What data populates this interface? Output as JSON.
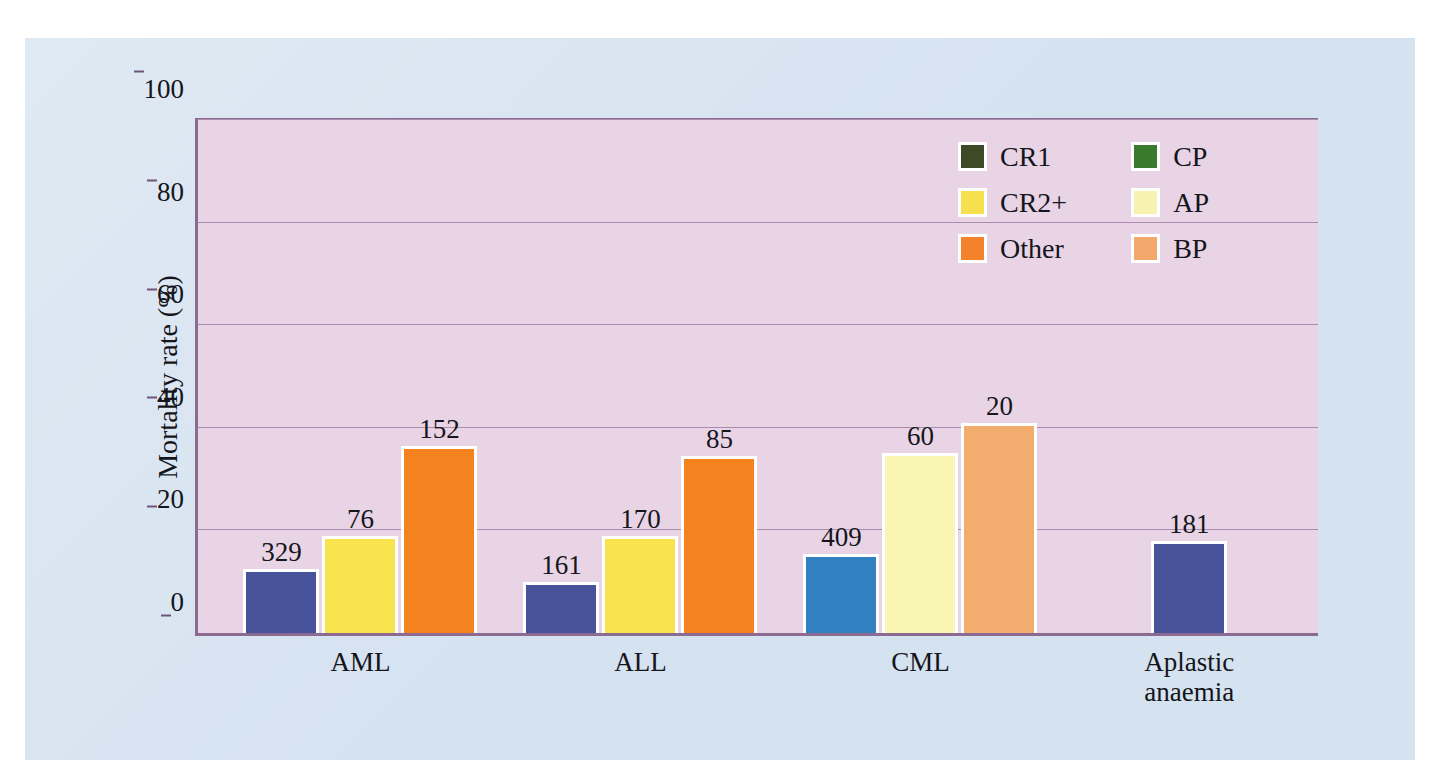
{
  "chart_data": {
    "type": "bar",
    "title": "",
    "xlabel": "",
    "ylabel": "Mortality rate (%)",
    "ylim": [
      0,
      100
    ],
    "yticks": [
      0,
      20,
      40,
      60,
      80,
      100
    ],
    "grid": true,
    "legend_position": "top-right",
    "categories": [
      "AML",
      "ALL",
      "CML",
      "Aplastic\nanaemia"
    ],
    "legend": [
      {
        "label": "CR1",
        "color": "#3c4a28"
      },
      {
        "label": "CR2+",
        "color": "#f7e04e"
      },
      {
        "label": "Other",
        "color": "#f4822a"
      },
      {
        "label": "CP",
        "color": "#3a7a2c"
      },
      {
        "label": "AP",
        "color": "#f7f2b0"
      },
      {
        "label": "BP",
        "color": "#f2a86a"
      }
    ],
    "groups": [
      {
        "category": "AML",
        "bars": [
          {
            "series": "CR1",
            "value": 12.5,
            "data_label": "329",
            "color": "#48529a"
          },
          {
            "series": "CR2+",
            "value": 19.0,
            "data_label": "76",
            "color": "#f9e44f"
          },
          {
            "series": "Other",
            "value": 36.5,
            "data_label": "152",
            "color": "#f4821f"
          }
        ]
      },
      {
        "category": "ALL",
        "bars": [
          {
            "series": "CR1",
            "value": 10.0,
            "data_label": "161",
            "color": "#48529a"
          },
          {
            "series": "CR2+",
            "value": 19.0,
            "data_label": "170",
            "color": "#f9e44f"
          },
          {
            "series": "Other",
            "value": 34.5,
            "data_label": "85",
            "color": "#f4821f"
          }
        ]
      },
      {
        "category": "CML",
        "bars": [
          {
            "series": "CP",
            "value": 15.5,
            "data_label": "409",
            "color": "#3281c0"
          },
          {
            "series": "AP",
            "value": 35.0,
            "data_label": "60",
            "color": "#f9f5b2"
          },
          {
            "series": "BP",
            "value": 41.0,
            "data_label": "20",
            "color": "#f2ac6e"
          }
        ]
      },
      {
        "category": "Aplastic\nanaemia",
        "bars": [
          {
            "series": "CR1",
            "value": 18.0,
            "data_label": "181",
            "color": "#48529a"
          }
        ]
      }
    ]
  },
  "colors": {
    "page_background": "#ffffff",
    "panel_background": "#d5e2f0",
    "plot_background": "#e8d4e4",
    "axis": "#8b6b92",
    "gridline": "#a98cae",
    "text": "#15151c",
    "bar_outline": "#ffffff"
  }
}
